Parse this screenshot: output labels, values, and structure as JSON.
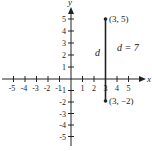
{
  "diagram": {
    "type": "coordinate-plane",
    "x_axis_label": "x",
    "y_axis_label": "y",
    "x_ticks": [
      "-5",
      "-4",
      "-3",
      "-2",
      "-1",
      "1",
      "2",
      "3",
      "4",
      "5"
    ],
    "y_ticks": [
      "5",
      "4",
      "3",
      "2",
      "1",
      "-1",
      "-2",
      "-3",
      "-4",
      "-5"
    ],
    "points": [
      {
        "label": "(3, 5)",
        "x": 3,
        "y": 5
      },
      {
        "label": "(3, −2)",
        "x": 3,
        "y": -2
      }
    ],
    "segment_label": "d",
    "distance_label": "d = 7",
    "colors": {
      "ink": "#222222",
      "background": "#ffffff"
    }
  }
}
